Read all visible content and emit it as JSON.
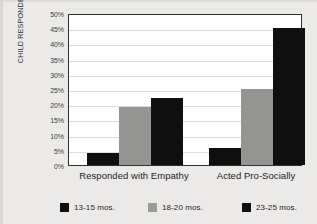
{
  "chart_data": {
    "type": "bar",
    "title": "",
    "subtitle": "",
    "xlabel": "",
    "ylabel": "% OF DISTRESSFUL EVENTS CHILD RESPONDED TO",
    "ylabel_line1": "% OF DISTRESSFUL EVENTS",
    "ylabel_line2": "CHILD RESPONDED TO",
    "categories": [
      "Responded with Empathy",
      "Acted Pro-Socially"
    ],
    "series": [
      {
        "name": "13-15 mos.",
        "values": [
          4,
          5.5
        ],
        "color": "#100f0f"
      },
      {
        "name": "18-20 mos.",
        "values": [
          19,
          25
        ],
        "color": "#949492"
      },
      {
        "name": "23-25 mos.",
        "values": [
          22,
          45
        ],
        "color": "#100f0f"
      }
    ],
    "ylim": [
      0,
      50
    ],
    "ytick_values": [
      0,
      5,
      10,
      15,
      20,
      25,
      30,
      35,
      40,
      45,
      50
    ],
    "ytick_labels": [
      "0%",
      "5%",
      "10%",
      "15%",
      "20%",
      "25%",
      "30%",
      "35%",
      "40%",
      "45%",
      "50%"
    ],
    "grid": true,
    "grid_axis": "y",
    "legend_position": "bottom",
    "plot_background": "#ffffff",
    "figure_background": "#eceae8",
    "axis_color": "#2f2f2f"
  },
  "axis": {
    "y_title_line1": "% OF DISTRESSFUL EVENTS",
    "y_title_line2": "CHILD RESPONDED TO"
  },
  "legend": {
    "items": [
      {
        "label": "13-15 mos."
      },
      {
        "label": "18-20 mos."
      },
      {
        "label": "23-25 mos."
      }
    ]
  }
}
